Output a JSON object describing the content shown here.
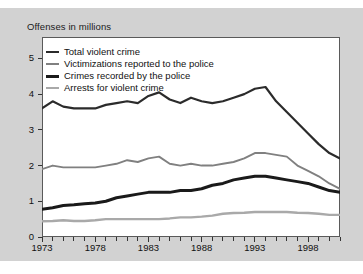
{
  "chart_data": {
    "type": "line",
    "title": "Offenses in millions",
    "xlabel": "",
    "ylabel": "",
    "xlim": [
      1973,
      2001
    ],
    "ylim": [
      0,
      5.6
    ],
    "grid": false,
    "legend_position": "top-left inside plot",
    "x": [
      1973,
      1974,
      1975,
      1976,
      1977,
      1978,
      1979,
      1980,
      1981,
      1982,
      1983,
      1984,
      1985,
      1986,
      1987,
      1988,
      1989,
      1990,
      1991,
      1992,
      1993,
      1994,
      1995,
      1996,
      1997,
      1998,
      1999,
      2000,
      2001
    ],
    "xticks": [
      1973,
      1978,
      1983,
      1988,
      1993,
      1998
    ],
    "xtick_labels": [
      "1973",
      "1978",
      "1983",
      "1988",
      "1993",
      "1998"
    ],
    "yticks": [
      0,
      1,
      2,
      3,
      4,
      5
    ],
    "ytick_labels": [
      "0",
      "1",
      "2",
      "3",
      "4",
      "5"
    ],
    "series": [
      {
        "name": "Total violent crime",
        "color": "#2b2b2b",
        "width": 2.2,
        "values": [
          3.6,
          3.8,
          3.65,
          3.6,
          3.6,
          3.6,
          3.7,
          3.75,
          3.8,
          3.75,
          3.95,
          4.05,
          3.85,
          3.75,
          3.9,
          3.8,
          3.75,
          3.8,
          3.9,
          4.0,
          4.15,
          4.2,
          3.8,
          3.5,
          3.2,
          2.9,
          2.6,
          2.35,
          2.2
        ]
      },
      {
        "name": "Victimizations reported to the police",
        "color": "#808080",
        "width": 1.9,
        "values": [
          1.9,
          2.0,
          1.95,
          1.95,
          1.95,
          1.95,
          2.0,
          2.05,
          2.15,
          2.1,
          2.2,
          2.25,
          2.05,
          2.0,
          2.05,
          2.0,
          2.0,
          2.05,
          2.1,
          2.2,
          2.35,
          2.35,
          2.3,
          2.25,
          2.0,
          1.85,
          1.7,
          1.5,
          1.35
        ]
      },
      {
        "name": "Crimes recorded by the police",
        "color": "#1a1a1a",
        "width": 3.0,
        "values": [
          0.78,
          0.82,
          0.88,
          0.9,
          0.93,
          0.95,
          1.0,
          1.1,
          1.15,
          1.2,
          1.25,
          1.25,
          1.25,
          1.3,
          1.3,
          1.35,
          1.45,
          1.5,
          1.6,
          1.65,
          1.7,
          1.7,
          1.65,
          1.6,
          1.55,
          1.5,
          1.4,
          1.3,
          1.25
        ]
      },
      {
        "name": "Arrests for violent crime",
        "color": "#a9a9a9",
        "width": 2.4,
        "values": [
          0.44,
          0.45,
          0.47,
          0.45,
          0.45,
          0.47,
          0.5,
          0.5,
          0.5,
          0.5,
          0.5,
          0.5,
          0.52,
          0.55,
          0.55,
          0.57,
          0.6,
          0.65,
          0.67,
          0.68,
          0.7,
          0.7,
          0.7,
          0.7,
          0.68,
          0.67,
          0.65,
          0.62,
          0.62
        ]
      }
    ]
  }
}
